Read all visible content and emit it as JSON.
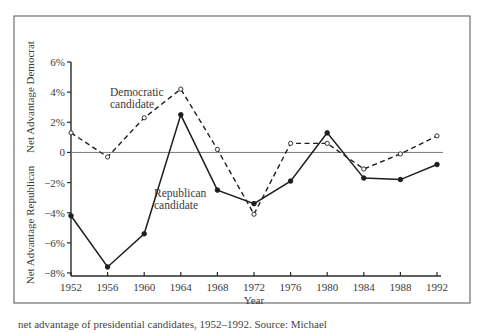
{
  "chart_data": {
    "type": "line",
    "title": "",
    "xlabel": "Year",
    "ylabel_top": "Net Advantage Democrat",
    "ylabel_bottom": "Net Advantage Republican",
    "x": [
      1952,
      1956,
      1960,
      1964,
      1968,
      1972,
      1976,
      1980,
      1984,
      1988,
      1992
    ],
    "x_tick_labels": [
      "1952",
      "1956",
      "1960",
      "1964",
      "1968",
      "1972",
      "1976",
      "1980",
      "1984",
      "1988",
      "1992"
    ],
    "y_ticks": [
      6,
      4,
      2,
      0,
      -2,
      -4,
      -6,
      -8
    ],
    "y_tick_labels": [
      "6%",
      "4%",
      "2%",
      "0",
      "−2%",
      "−4%",
      "−6%",
      "−8%"
    ],
    "ylim": [
      -8,
      6
    ],
    "grid": false,
    "series": [
      {
        "name": "Democratic candidate",
        "style": "dashed",
        "marker": "open-circle",
        "values": [
          1.3,
          -0.3,
          2.3,
          4.2,
          0.2,
          -4.1,
          0.6,
          0.6,
          -1.1,
          -0.1,
          1.1
        ]
      },
      {
        "name": "Republican candidate",
        "style": "solid",
        "marker": "filled-circle",
        "values": [
          -4.2,
          -7.6,
          -5.4,
          2.5,
          -2.5,
          -3.4,
          -1.9,
          1.3,
          -1.7,
          -1.8,
          -0.8
        ]
      }
    ],
    "annotations": [
      {
        "text_lines": [
          "Democratic",
          "candidate"
        ],
        "series": "Democratic candidate"
      },
      {
        "text_lines": [
          "Republican",
          "candidate"
        ],
        "series": "Republican candidate"
      }
    ]
  },
  "caption": "net advantage of presidential candidates, 1952–1992. Source: Michael"
}
